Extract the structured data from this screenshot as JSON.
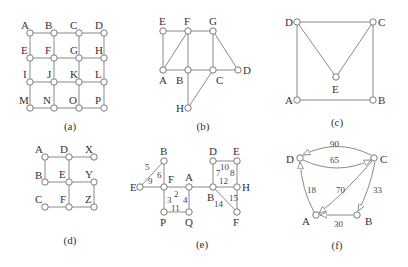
{
  "figure": {
    "background": "#ffffff",
    "edge_color": "#8a8a8a",
    "panels": [
      {
        "id": "a",
        "caption": "(a)",
        "type": "undirected",
        "nodes": [
          {
            "id": "A",
            "x": 30,
            "y": 33,
            "lx": -9,
            "ly": -4
          },
          {
            "id": "B",
            "x": 54,
            "y": 33,
            "lx": -9,
            "ly": -4
          },
          {
            "id": "C",
            "x": 79,
            "y": 33,
            "lx": -9,
            "ly": -4
          },
          {
            "id": "D",
            "x": 104,
            "y": 33,
            "lx": -9,
            "ly": -4
          },
          {
            "id": "E",
            "x": 30,
            "y": 58,
            "lx": -9,
            "ly": -4
          },
          {
            "id": "F",
            "x": 54,
            "y": 58,
            "lx": -9,
            "ly": -4
          },
          {
            "id": "G",
            "x": 79,
            "y": 58,
            "lx": -9,
            "ly": -4
          },
          {
            "id": "H",
            "x": 104,
            "y": 58,
            "lx": -9,
            "ly": -4
          },
          {
            "id": "I",
            "x": 30,
            "y": 82,
            "lx": -7,
            "ly": -4
          },
          {
            "id": "J",
            "x": 54,
            "y": 82,
            "lx": -7,
            "ly": -4
          },
          {
            "id": "K",
            "x": 79,
            "y": 82,
            "lx": -9,
            "ly": -4
          },
          {
            "id": "L",
            "x": 104,
            "y": 82,
            "lx": -9,
            "ly": -4
          },
          {
            "id": "M",
            "x": 30,
            "y": 108,
            "lx": -11,
            "ly": -4
          },
          {
            "id": "N",
            "x": 54,
            "y": 108,
            "lx": -11,
            "ly": -4
          },
          {
            "id": "O",
            "x": 79,
            "y": 108,
            "lx": -10,
            "ly": -4
          },
          {
            "id": "P",
            "x": 104,
            "y": 108,
            "lx": -9,
            "ly": -4
          }
        ],
        "edges": [
          [
            "A",
            "B"
          ],
          [
            "B",
            "C"
          ],
          [
            "C",
            "D"
          ],
          [
            "E",
            "F"
          ],
          [
            "F",
            "G"
          ],
          [
            "G",
            "H"
          ],
          [
            "I",
            "J"
          ],
          [
            "J",
            "K"
          ],
          [
            "K",
            "L"
          ],
          [
            "M",
            "N"
          ],
          [
            "N",
            "O"
          ],
          [
            "O",
            "P"
          ],
          [
            "A",
            "E"
          ],
          [
            "E",
            "I"
          ],
          [
            "I",
            "M"
          ],
          [
            "B",
            "F"
          ],
          [
            "F",
            "J"
          ],
          [
            "J",
            "N"
          ],
          [
            "C",
            "G"
          ],
          [
            "G",
            "K"
          ],
          [
            "K",
            "O"
          ],
          [
            "D",
            "H"
          ],
          [
            "H",
            "L"
          ],
          [
            "L",
            "P"
          ]
        ],
        "caption_pos": [
          70,
          130
        ]
      },
      {
        "id": "b",
        "caption": "(b)",
        "type": "undirected",
        "nodes": [
          {
            "id": "E",
            "x": 163,
            "y": 31,
            "lx": -4,
            "ly": -6
          },
          {
            "id": "F",
            "x": 188,
            "y": 31,
            "lx": -4,
            "ly": -6
          },
          {
            "id": "G",
            "x": 213,
            "y": 31,
            "lx": -4,
            "ly": -6
          },
          {
            "id": "A",
            "x": 163,
            "y": 70,
            "lx": -4,
            "ly": 14
          },
          {
            "id": "B",
            "x": 188,
            "y": 70,
            "lx": -12,
            "ly": 14
          },
          {
            "id": "C",
            "x": 213,
            "y": 70,
            "lx": 3,
            "ly": 14
          },
          {
            "id": "D",
            "x": 238,
            "y": 70,
            "lx": 5,
            "ly": 4
          },
          {
            "id": "H",
            "x": 188,
            "y": 108,
            "lx": -12,
            "ly": 4
          }
        ],
        "edges": [
          [
            "E",
            "F"
          ],
          [
            "F",
            "G"
          ],
          [
            "E",
            "A"
          ],
          [
            "A",
            "F"
          ],
          [
            "F",
            "B"
          ],
          [
            "A",
            "B"
          ],
          [
            "B",
            "C"
          ],
          [
            "C",
            "D"
          ],
          [
            "G",
            "C"
          ],
          [
            "G",
            "D"
          ],
          [
            "B",
            "H"
          ],
          [
            "C",
            "H"
          ]
        ],
        "caption_pos": [
          203,
          130
        ]
      },
      {
        "id": "c",
        "caption": "(c)",
        "type": "undirected",
        "nodes": [
          {
            "id": "D",
            "x": 297,
            "y": 22,
            "lx": -12,
            "ly": 4
          },
          {
            "id": "C",
            "x": 373,
            "y": 22,
            "lx": 5,
            "ly": 4
          },
          {
            "id": "E",
            "x": 336,
            "y": 77,
            "lx": -4,
            "ly": 16
          },
          {
            "id": "A",
            "x": 297,
            "y": 100,
            "lx": -12,
            "ly": 4
          },
          {
            "id": "B",
            "x": 373,
            "y": 100,
            "lx": 5,
            "ly": 4
          }
        ],
        "edges": [
          [
            "D",
            "C"
          ],
          [
            "D",
            "A"
          ],
          [
            "C",
            "B"
          ],
          [
            "A",
            "B"
          ],
          [
            "D",
            "E"
          ],
          [
            "C",
            "E"
          ]
        ],
        "caption_pos": [
          337,
          126
        ]
      },
      {
        "id": "d",
        "caption": "(d)",
        "type": "undirected",
        "nodes": [
          {
            "id": "A",
            "x": 45,
            "y": 157,
            "lx": -10,
            "ly": -4
          },
          {
            "id": "D",
            "x": 69,
            "y": 157,
            "lx": -9,
            "ly": -4
          },
          {
            "id": "X",
            "x": 94,
            "y": 157,
            "lx": -9,
            "ly": -4
          },
          {
            "id": "B",
            "x": 45,
            "y": 182,
            "lx": -10,
            "ly": -3
          },
          {
            "id": "E",
            "x": 69,
            "y": 182,
            "lx": -10,
            "ly": -4
          },
          {
            "id": "Y",
            "x": 94,
            "y": 182,
            "lx": -9,
            "ly": -4
          },
          {
            "id": "C",
            "x": 45,
            "y": 207,
            "lx": -10,
            "ly": -4
          },
          {
            "id": "F",
            "x": 69,
            "y": 207,
            "lx": -9,
            "ly": -4
          },
          {
            "id": "Z",
            "x": 94,
            "y": 207,
            "lx": -9,
            "ly": -4
          }
        ],
        "edges": [
          [
            "A",
            "D"
          ],
          [
            "D",
            "X"
          ],
          [
            "A",
            "B"
          ],
          [
            "D",
            "E"
          ],
          [
            "B",
            "E"
          ],
          [
            "E",
            "Y"
          ],
          [
            "E",
            "F"
          ],
          [
            "Y",
            "Z"
          ],
          [
            "C",
            "F"
          ],
          [
            "F",
            "Z"
          ]
        ],
        "caption_pos": [
          70,
          244
        ]
      },
      {
        "id": "e",
        "caption": "(e)",
        "type": "weighted-undirected",
        "nodes": [
          {
            "id": "B",
            "x": 164,
            "y": 161,
            "lx": -4,
            "ly": -6
          },
          {
            "id": "E",
            "x": 140,
            "y": 187,
            "lx": -10,
            "ly": 4
          },
          {
            "id": "F",
            "x": 164,
            "y": 187,
            "lx": 4,
            "ly": -4
          },
          {
            "id": "A",
            "x": 189,
            "y": 187,
            "lx": -4,
            "ly": -6
          },
          {
            "id": "P",
            "x": 164,
            "y": 212,
            "lx": -4,
            "ly": 14
          },
          {
            "id": "Q",
            "x": 189,
            "y": 212,
            "lx": -4,
            "ly": 14
          },
          {
            "id": "D",
            "x": 213,
            "y": 161,
            "lx": -4,
            "ly": -6
          },
          {
            "id": "E",
            "x": 237,
            "y": 161,
            "lx": -4,
            "ly": -6
          },
          {
            "id": "B",
            "x": 213,
            "y": 187,
            "lx": -6,
            "ly": 14
          },
          {
            "id": "H",
            "x": 237,
            "y": 187,
            "lx": 5,
            "ly": 4
          },
          {
            "id": "F",
            "x": 237,
            "y": 212,
            "lx": -4,
            "ly": 14
          }
        ],
        "edges": [
          {
            "from": 0,
            "to": 1,
            "w": "5",
            "wx": 145,
            "wy": 170
          },
          {
            "from": 1,
            "to": 2,
            "w": "9",
            "wx": 148,
            "wy": 184
          },
          {
            "from": 0,
            "to": 2,
            "w": "6",
            "wx": 157,
            "wy": 178
          },
          {
            "from": 2,
            "to": 3,
            "w": "2",
            "wx": 174,
            "wy": 197
          },
          {
            "from": 2,
            "to": 4,
            "w": "3",
            "wx": 167,
            "wy": 203
          },
          {
            "from": 3,
            "to": 5,
            "w": "4",
            "wx": 183,
            "wy": 203
          },
          {
            "from": 4,
            "to": 5,
            "w": "11",
            "wx": 171,
            "wy": 211
          },
          {
            "from": 3,
            "to": 8,
            "w": "",
            "wx": 0,
            "wy": 0
          },
          {
            "from": 8,
            "to": 6,
            "w": "7",
            "wx": 216,
            "wy": 176
          },
          {
            "from": 6,
            "to": 7,
            "w": "10",
            "wx": 220,
            "wy": 170
          },
          {
            "from": 7,
            "to": 9,
            "w": "8",
            "wx": 230,
            "wy": 176
          },
          {
            "from": 8,
            "to": 9,
            "w": "12",
            "wx": 219,
            "wy": 184
          },
          {
            "from": 8,
            "to": 10,
            "w": "14",
            "wx": 214,
            "wy": 207
          },
          {
            "from": 9,
            "to": 10,
            "w": "15",
            "wx": 229,
            "wy": 201
          }
        ],
        "caption_pos": [
          202,
          248
        ]
      },
      {
        "id": "f",
        "caption": "(f)",
        "type": "weighted-directed",
        "nodes": [
          {
            "id": "D",
            "x": 300,
            "y": 158,
            "lx": -14,
            "ly": 5
          },
          {
            "id": "C",
            "x": 374,
            "y": 158,
            "lx": 6,
            "ly": 5
          },
          {
            "id": "A",
            "x": 316,
            "y": 215,
            "lx": -14,
            "ly": 10
          },
          {
            "id": "B",
            "x": 357,
            "y": 215,
            "lx": 8,
            "ly": 10
          }
        ],
        "edges": [
          {
            "from": "C",
            "to": "D",
            "w": "90",
            "path": "M371,155 Q337,138 303,155",
            "wx": 330,
            "wy": 147
          },
          {
            "from": "D",
            "to": "C",
            "w": "65",
            "path": "M303,160 Q337,176 371,160",
            "wx": 330,
            "wy": 163
          },
          {
            "from": "A",
            "to": "D",
            "w": "18",
            "path": "M314,212 Q302,190 300,162",
            "wx": 307,
            "wy": 193
          },
          {
            "from": "C",
            "to": "A",
            "w": "70",
            "path": "M372,161 Q344,194 319,213",
            "wx": 336,
            "wy": 193
          },
          {
            "from": "C",
            "to": "B",
            "w": "33",
            "path": "M375,162 Q369,192 358,211",
            "wx": 373,
            "wy": 193
          },
          {
            "from": "B",
            "to": "A",
            "w": "30",
            "path": "M353,215 L320,215",
            "wx": 334,
            "wy": 227
          }
        ],
        "caption_pos": [
          337,
          249
        ]
      }
    ]
  }
}
